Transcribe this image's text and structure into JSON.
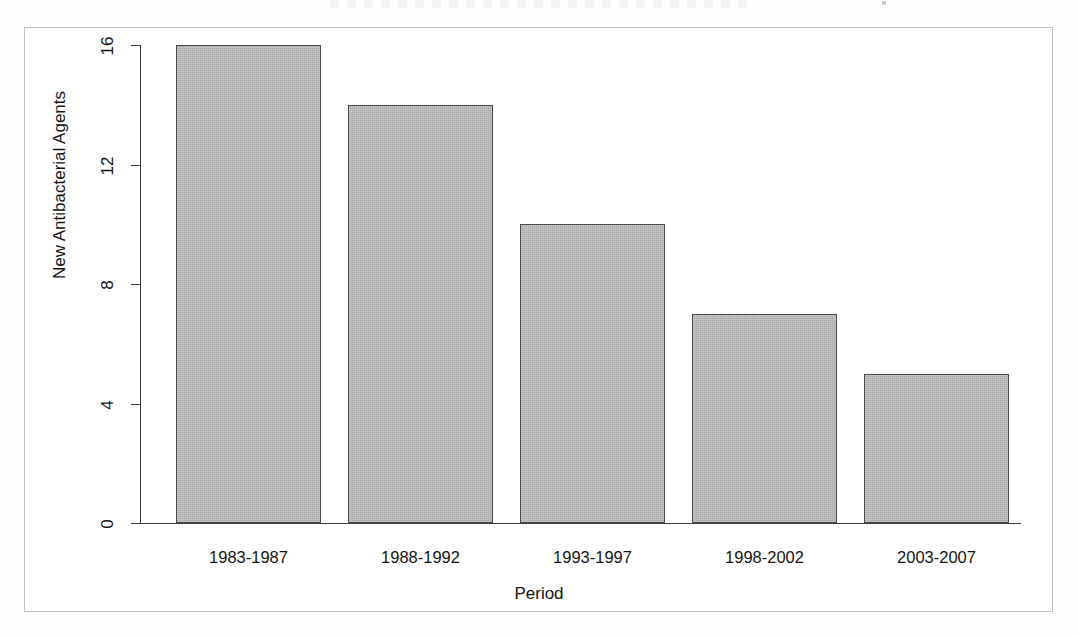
{
  "figure": {
    "has_border_frame": true,
    "background_color": "#ffffff"
  },
  "chart_data": {
    "type": "bar",
    "title": "",
    "xlabel": "Period",
    "ylabel": "New Antibacterial Agents",
    "categories": [
      "1983-1987",
      "1988-1992",
      "1993-1997",
      "1998-2002",
      "2003-2007"
    ],
    "values": [
      16,
      14,
      10,
      7,
      5
    ],
    "yticks": [
      0,
      4,
      8,
      12,
      16
    ],
    "ytick_labels": [
      "0",
      "4",
      "8",
      "12",
      "16"
    ],
    "ylim": [
      0,
      16
    ],
    "grid": false,
    "legend": null,
    "bar_fill_color": "#b4b4b4",
    "bar_edge_color": "#4a4a4a",
    "axis_color": "#3d3d3d",
    "frame_color": "#c2c2c2",
    "text_color": "#141414",
    "annotations": []
  }
}
